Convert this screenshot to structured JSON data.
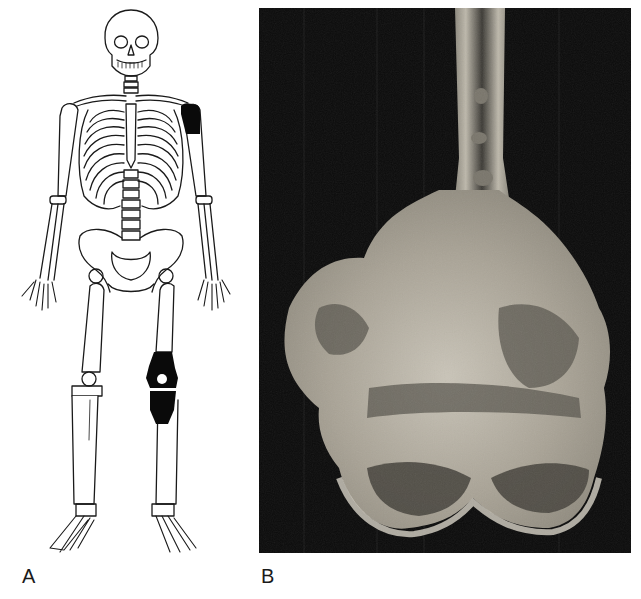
{
  "figure": {
    "panels": [
      {
        "label": "A",
        "description": "Skeleton line drawing with lesion sites shaded black",
        "highlighted_sites": [
          "proximal humerus",
          "distal femur",
          "proximal tibia"
        ]
      },
      {
        "label": "B",
        "description": "Gross photograph of sectioned distal femur specimen"
      }
    ]
  },
  "colors": {
    "background": "#ffffff",
    "line": "#1a1a1a",
    "lesion": "#0a0a0a",
    "photo_background": "#0b0b0b",
    "bone_light": "#cfcabd",
    "bone_mid": "#a8a294",
    "bone_dark": "#4a4740"
  }
}
